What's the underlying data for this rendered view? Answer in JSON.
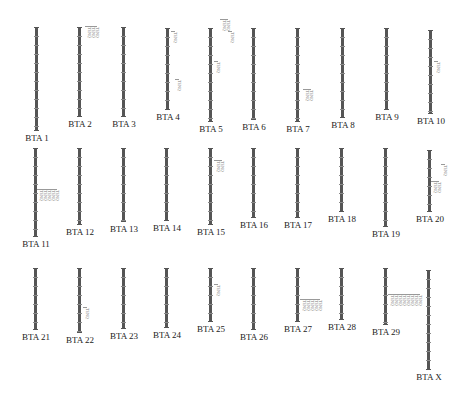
{
  "diagram": {
    "type": "chromosome-map",
    "marker_label": "TENQ",
    "chromosomes": [
      {
        "name": "BTA 1",
        "x": 36,
        "top": 27,
        "bottom": 131,
        "markers": []
      },
      {
        "name": "BTA 2",
        "x": 79,
        "top": 27,
        "bottom": 117,
        "markers": [
          {
            "y": 27,
            "count": 3,
            "dx": 8
          }
        ]
      },
      {
        "name": "BTA 3",
        "x": 123,
        "top": 27,
        "bottom": 117,
        "markers": []
      },
      {
        "name": "BTA 4",
        "x": 167,
        "top": 28,
        "bottom": 110,
        "markers": [
          {
            "y": 32,
            "count": 1,
            "dx": 6
          },
          {
            "y": 80,
            "count": 1,
            "dx": 10
          }
        ]
      },
      {
        "name": "BTA 5",
        "x": 210,
        "top": 28,
        "bottom": 122,
        "markers": [
          {
            "y": 62,
            "count": 1,
            "dx": 6
          },
          {
            "y": 20,
            "count": 2,
            "dx": 12
          },
          {
            "y": 32,
            "count": 1,
            "dx": 20
          }
        ]
      },
      {
        "name": "BTA 6",
        "x": 253,
        "top": 28,
        "bottom": 120,
        "markers": []
      },
      {
        "name": "BTA 7",
        "x": 297,
        "top": 28,
        "bottom": 122,
        "markers": [
          {
            "y": 90,
            "count": 2,
            "dx": 8
          }
        ]
      },
      {
        "name": "BTA 8",
        "x": 342,
        "top": 28,
        "bottom": 118,
        "markers": []
      },
      {
        "name": "BTA 9",
        "x": 386,
        "top": 28,
        "bottom": 110,
        "markers": []
      },
      {
        "name": "BTA 10",
        "x": 430,
        "top": 30,
        "bottom": 114,
        "markers": [
          {
            "y": 62,
            "count": 1,
            "dx": 6
          }
        ]
      },
      {
        "name": "BTA 11",
        "x": 35,
        "top": 148,
        "bottom": 237,
        "markers": [
          {
            "y": 190,
            "count": 5,
            "dx": 4
          }
        ]
      },
      {
        "name": "BTA 12",
        "x": 79,
        "top": 148,
        "bottom": 225,
        "markers": []
      },
      {
        "name": "BTA 13",
        "x": 123,
        "top": 148,
        "bottom": 222,
        "markers": []
      },
      {
        "name": "BTA 14",
        "x": 166,
        "top": 148,
        "bottom": 221,
        "markers": []
      },
      {
        "name": "BTA 15",
        "x": 210,
        "top": 148,
        "bottom": 225,
        "markers": [
          {
            "y": 161,
            "count": 2,
            "dx": 6
          }
        ]
      },
      {
        "name": "BTA 16",
        "x": 253,
        "top": 148,
        "bottom": 218,
        "markers": []
      },
      {
        "name": "BTA 17",
        "x": 297,
        "top": 148,
        "bottom": 218,
        "markers": []
      },
      {
        "name": "BTA 18",
        "x": 341,
        "top": 148,
        "bottom": 212,
        "markers": []
      },
      {
        "name": "BTA 19",
        "x": 385,
        "top": 148,
        "bottom": 227,
        "markers": []
      },
      {
        "name": "BTA 20",
        "x": 429,
        "top": 150,
        "bottom": 212,
        "markers": [
          {
            "y": 182,
            "count": 2,
            "dx": 4
          },
          {
            "y": 165,
            "count": 1,
            "dx": 14
          }
        ]
      },
      {
        "name": "BTA 21",
        "x": 35,
        "top": 268,
        "bottom": 330,
        "markers": []
      },
      {
        "name": "BTA 22",
        "x": 79,
        "top": 268,
        "bottom": 333,
        "markers": [
          {
            "y": 308,
            "count": 1,
            "dx": 6
          }
        ]
      },
      {
        "name": "BTA 23",
        "x": 123,
        "top": 268,
        "bottom": 329,
        "markers": []
      },
      {
        "name": "BTA 24",
        "x": 166,
        "top": 268,
        "bottom": 328,
        "markers": []
      },
      {
        "name": "BTA 25",
        "x": 210,
        "top": 268,
        "bottom": 322,
        "markers": [
          {
            "y": 285,
            "count": 1,
            "dx": 6
          }
        ]
      },
      {
        "name": "BTA 26",
        "x": 253,
        "top": 268,
        "bottom": 330,
        "markers": []
      },
      {
        "name": "BTA 27",
        "x": 297,
        "top": 268,
        "bottom": 322,
        "markers": [
          {
            "y": 300,
            "count": 5,
            "dx": 5
          }
        ]
      },
      {
        "name": "BTA 28",
        "x": 341,
        "top": 268,
        "bottom": 320,
        "markers": []
      },
      {
        "name": "BTA 29",
        "x": 385,
        "top": 268,
        "bottom": 325,
        "markers": [
          {
            "y": 295,
            "count": 8,
            "dx": 5
          }
        ]
      },
      {
        "name": "BTA X",
        "x": 428,
        "top": 270,
        "bottom": 370,
        "markers": []
      }
    ]
  }
}
